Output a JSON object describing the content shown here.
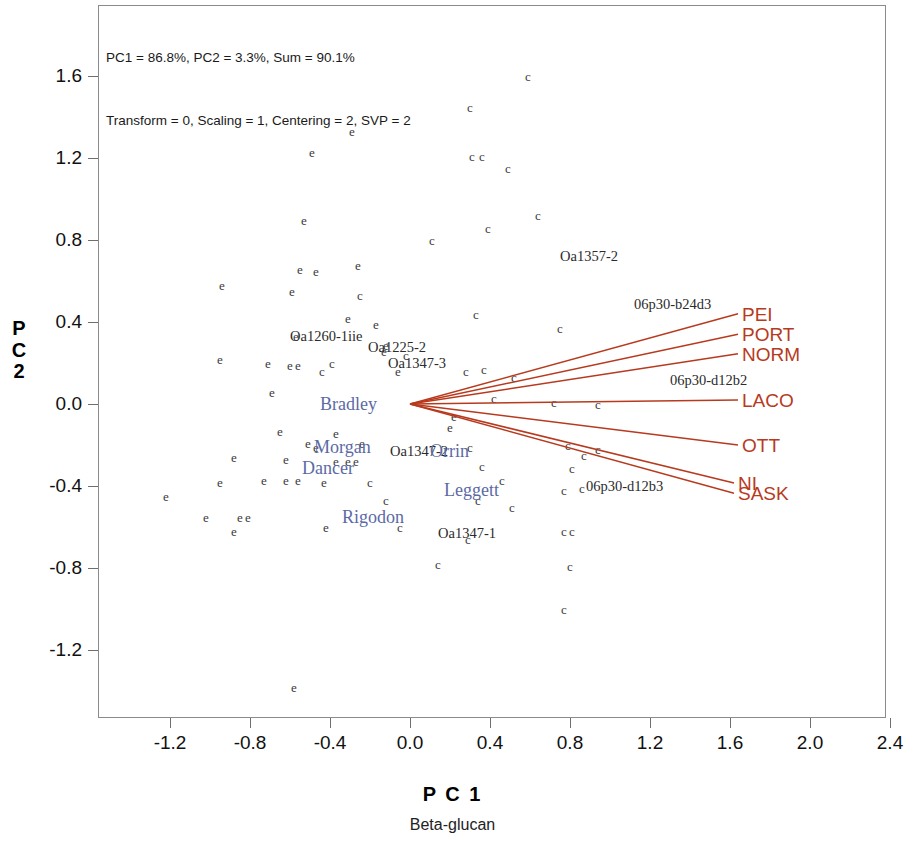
{
  "header": {
    "line1": "PC1 = 86.8%, PC2 = 3.3%, Sum = 90.1%",
    "line2": "Transform = 0, Scaling = 1, Centering = 2, SVP = 2"
  },
  "axis_title_x": "P C 1",
  "axis_title_y": [
    "P",
    "C",
    "2"
  ],
  "subtitle": "Beta-glucan",
  "colors": {
    "vector": "#b83a1e",
    "genotype_label": "#5b6aa5",
    "point": "#3a3a3a",
    "frame": "#8b8b8b"
  },
  "chart_data": {
    "type": "scatter",
    "title": "Beta-glucan",
    "subtitle": "PC1 = 86.8%, PC2 = 3.3%, Sum = 90.1%",
    "xlabel": "P C 1",
    "ylabel": "P C 2",
    "xlim": [
      -1.45,
      2.55
    ],
    "ylim": [
      -1.45,
      1.78
    ],
    "xticks": [
      "-1.2",
      "-0.8",
      "-0.4",
      "0.0",
      "0.4",
      "0.8",
      "1.2",
      "1.6",
      "2.0",
      "2.4"
    ],
    "yticks": [
      "1.6",
      "1.2",
      "0.8",
      "0.4",
      "0.0",
      "-0.4",
      "-0.8",
      "-1.2"
    ],
    "xtick_values": [
      -1.2,
      -0.8,
      -0.4,
      0.0,
      0.4,
      0.8,
      1.2,
      1.6,
      2.0,
      2.4
    ],
    "ytick_values": [
      1.6,
      1.2,
      0.8,
      0.4,
      0.0,
      -0.4,
      -0.8,
      -1.2
    ],
    "grid": false,
    "legend": "none",
    "origin": [
      0.0,
      0.0
    ],
    "point_marker_glyphs": [
      "e",
      "c"
    ],
    "points": [
      {
        "x": 0.59,
        "y": 1.6,
        "g": "c"
      },
      {
        "x": 0.3,
        "y": 1.45,
        "g": "c"
      },
      {
        "x": -0.29,
        "y": 1.33,
        "g": "e"
      },
      {
        "x": -0.49,
        "y": 1.23,
        "g": "e"
      },
      {
        "x": 0.31,
        "y": 1.21,
        "g": "c"
      },
      {
        "x": 0.36,
        "y": 1.21,
        "g": "c"
      },
      {
        "x": 0.49,
        "y": 1.15,
        "g": "c"
      },
      {
        "x": -0.53,
        "y": 0.9,
        "g": "e"
      },
      {
        "x": 0.64,
        "y": 0.92,
        "g": "c"
      },
      {
        "x": 0.39,
        "y": 0.86,
        "g": "c"
      },
      {
        "x": 0.11,
        "y": 0.8,
        "g": "c"
      },
      {
        "x": -0.55,
        "y": 0.66,
        "g": "e"
      },
      {
        "x": -0.47,
        "y": 0.65,
        "g": "e"
      },
      {
        "x": -0.26,
        "y": 0.68,
        "g": "e"
      },
      {
        "x": -0.94,
        "y": 0.58,
        "g": "e"
      },
      {
        "x": -0.59,
        "y": 0.55,
        "g": "e"
      },
      {
        "x": -0.25,
        "y": 0.53,
        "g": "c"
      },
      {
        "x": -0.31,
        "y": 0.42,
        "g": "e"
      },
      {
        "x": -0.57,
        "y": 0.33,
        "g": "e"
      },
      {
        "x": -0.17,
        "y": 0.39,
        "g": "e"
      },
      {
        "x": 0.75,
        "y": 0.37,
        "g": "c"
      },
      {
        "x": -0.12,
        "y": 0.29,
        "g": "e"
      },
      {
        "x": -0.13,
        "y": 0.26,
        "g": "e"
      },
      {
        "x": -0.02,
        "y": 0.24,
        "g": "c"
      },
      {
        "x": -0.95,
        "y": 0.22,
        "g": "e"
      },
      {
        "x": -0.71,
        "y": 0.2,
        "g": "e"
      },
      {
        "x": -0.6,
        "y": 0.19,
        "g": "e"
      },
      {
        "x": -0.56,
        "y": 0.19,
        "g": "e"
      },
      {
        "x": -0.44,
        "y": 0.16,
        "g": "c"
      },
      {
        "x": -0.39,
        "y": 0.2,
        "g": "c"
      },
      {
        "x": -0.06,
        "y": 0.16,
        "g": "e"
      },
      {
        "x": 0.28,
        "y": 0.16,
        "g": "c"
      },
      {
        "x": 0.37,
        "y": 0.17,
        "g": "c"
      },
      {
        "x": 0.52,
        "y": 0.13,
        "g": "c"
      },
      {
        "x": 0.33,
        "y": 0.44,
        "g": "c"
      },
      {
        "x": -0.69,
        "y": 0.06,
        "g": "e"
      },
      {
        "x": 0.42,
        "y": 0.03,
        "g": "c"
      },
      {
        "x": 0.72,
        "y": 0.01,
        "g": "c"
      },
      {
        "x": 0.94,
        "y": 0.0,
        "g": "c"
      },
      {
        "x": 0.22,
        "y": -0.06,
        "g": "e"
      },
      {
        "x": 0.2,
        "y": -0.11,
        "g": "e"
      },
      {
        "x": -0.65,
        "y": -0.13,
        "g": "e"
      },
      {
        "x": -0.37,
        "y": -0.14,
        "g": "e"
      },
      {
        "x": -0.51,
        "y": -0.19,
        "g": "e"
      },
      {
        "x": -0.47,
        "y": -0.21,
        "g": "e"
      },
      {
        "x": -0.24,
        "y": -0.19,
        "g": "e"
      },
      {
        "x": 0.3,
        "y": -0.21,
        "g": "c"
      },
      {
        "x": 0.79,
        "y": -0.2,
        "g": "c"
      },
      {
        "x": 0.94,
        "y": -0.22,
        "g": "c"
      },
      {
        "x": 0.87,
        "y": -0.25,
        "g": "c"
      },
      {
        "x": -0.88,
        "y": -0.26,
        "g": "e"
      },
      {
        "x": -0.62,
        "y": -0.27,
        "g": "e"
      },
      {
        "x": -0.37,
        "y": -0.28,
        "g": "e"
      },
      {
        "x": -0.31,
        "y": -0.28,
        "g": "e"
      },
      {
        "x": -0.27,
        "y": -0.28,
        "g": "e"
      },
      {
        "x": 0.36,
        "y": -0.3,
        "g": "c"
      },
      {
        "x": 0.81,
        "y": -0.31,
        "g": "c"
      },
      {
        "x": -1.22,
        "y": -0.45,
        "g": "e"
      },
      {
        "x": -0.95,
        "y": -0.38,
        "g": "e"
      },
      {
        "x": -0.73,
        "y": -0.37,
        "g": "e"
      },
      {
        "x": -0.62,
        "y": -0.37,
        "g": "e"
      },
      {
        "x": -0.56,
        "y": -0.37,
        "g": "e"
      },
      {
        "x": -0.43,
        "y": -0.38,
        "g": "e"
      },
      {
        "x": -0.2,
        "y": -0.38,
        "g": "c"
      },
      {
        "x": 0.46,
        "y": -0.37,
        "g": "c"
      },
      {
        "x": 0.77,
        "y": -0.42,
        "g": "c"
      },
      {
        "x": 0.86,
        "y": -0.41,
        "g": "c"
      },
      {
        "x": -0.12,
        "y": -0.47,
        "g": "c"
      },
      {
        "x": 0.34,
        "y": -0.47,
        "g": "c"
      },
      {
        "x": 0.51,
        "y": -0.5,
        "g": "c"
      },
      {
        "x": -1.02,
        "y": -0.55,
        "g": "e"
      },
      {
        "x": -0.85,
        "y": -0.55,
        "g": "e"
      },
      {
        "x": -0.81,
        "y": -0.55,
        "g": "e"
      },
      {
        "x": -0.88,
        "y": -0.62,
        "g": "e"
      },
      {
        "x": -0.42,
        "y": -0.6,
        "g": "e"
      },
      {
        "x": -0.05,
        "y": -0.6,
        "g": "c"
      },
      {
        "x": 0.77,
        "y": -0.62,
        "g": "c"
      },
      {
        "x": 0.81,
        "y": -0.62,
        "g": "c"
      },
      {
        "x": 0.29,
        "y": -0.66,
        "g": "c"
      },
      {
        "x": 0.14,
        "y": -0.78,
        "g": "c"
      },
      {
        "x": 0.8,
        "y": -0.79,
        "g": "c"
      },
      {
        "x": 0.77,
        "y": -1.0,
        "g": "c"
      },
      {
        "x": -0.58,
        "y": -1.38,
        "g": "e"
      }
    ],
    "vectors": [
      {
        "label": "PEI",
        "x": 1.64,
        "y": 0.44
      },
      {
        "label": "PORT",
        "x": 1.64,
        "y": 0.34
      },
      {
        "label": "NORM",
        "x": 1.64,
        "y": 0.245
      },
      {
        "label": "LACO",
        "x": 1.64,
        "y": 0.02
      },
      {
        "label": "OTT",
        "x": 1.64,
        "y": -0.2
      },
      {
        "label": "NI",
        "x": 1.62,
        "y": -0.385
      },
      {
        "label": "SASK",
        "x": 1.62,
        "y": -0.435
      }
    ],
    "point_labels": [
      {
        "text": "Oa1260-1iie",
        "x": -0.6,
        "y": 0.33,
        "color": "black",
        "anchor": "start"
      },
      {
        "text": "Oa1225-2",
        "x": -0.21,
        "y": 0.28,
        "color": "black",
        "anchor": "start"
      },
      {
        "text": "Oa1347-3",
        "x": -0.11,
        "y": 0.2,
        "color": "black",
        "anchor": "start"
      },
      {
        "text": "Oa1357-2",
        "x": 0.75,
        "y": 0.72,
        "color": "black",
        "anchor": "start"
      },
      {
        "text": "06p30-b24d3",
        "x": 1.12,
        "y": 0.49,
        "color": "black",
        "anchor": "start"
      },
      {
        "text": "06p30-d12b2",
        "x": 1.3,
        "y": 0.115,
        "color": "black",
        "anchor": "start"
      },
      {
        "text": "06p30-d12b3",
        "x": 0.88,
        "y": -0.4,
        "color": "black",
        "anchor": "start"
      },
      {
        "text": "Oa1347-2",
        "x": -0.1,
        "y": -0.23,
        "color": "black",
        "anchor": "start"
      },
      {
        "text": "Oa1347-1",
        "x": 0.14,
        "y": -0.63,
        "color": "black",
        "anchor": "start"
      },
      {
        "text": "Bradley",
        "x": -0.45,
        "y": 0.0,
        "color": "blue",
        "anchor": "start"
      },
      {
        "text": "Morgan",
        "x": -0.48,
        "y": -0.21,
        "color": "blue",
        "anchor": "start"
      },
      {
        "text": "Orrin",
        "x": 0.1,
        "y": -0.23,
        "color": "blue",
        "anchor": "start"
      },
      {
        "text": "Dancer",
        "x": -0.54,
        "y": -0.31,
        "color": "blue",
        "anchor": "start"
      },
      {
        "text": "Leggett",
        "x": 0.17,
        "y": -0.42,
        "color": "blue",
        "anchor": "start"
      },
      {
        "text": "Rigodon",
        "x": -0.34,
        "y": -0.55,
        "color": "blue",
        "anchor": "start"
      }
    ]
  }
}
